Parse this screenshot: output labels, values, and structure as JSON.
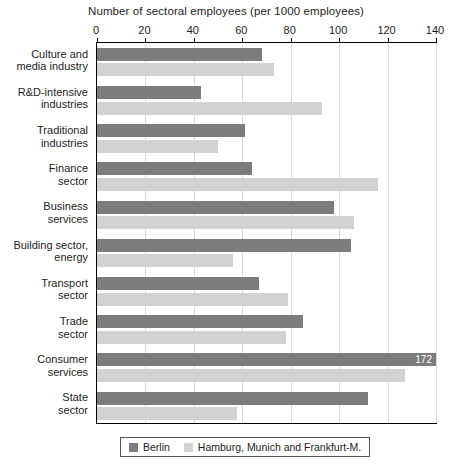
{
  "chart_data": {
    "type": "bar",
    "orientation": "horizontal",
    "title": "Number of sectoral employees (per 1000 employees)",
    "xlabel": "",
    "ylabel": "",
    "xlim": [
      0,
      140
    ],
    "xticks": [
      0,
      20,
      40,
      60,
      80,
      100,
      120,
      140
    ],
    "grid": true,
    "legend_position": "bottom",
    "categories": [
      "Culture and media industry",
      "R&D-intensive industries",
      "Traditional industries",
      "Finance sector",
      "Business services",
      "Building sector, energy",
      "Transport sector",
      "Trade sector",
      "Consumer services",
      "State sector"
    ],
    "category_lines": [
      [
        "Culture and",
        "media industry"
      ],
      [
        "R&D-intensive",
        "industries"
      ],
      [
        "Traditional",
        "industries"
      ],
      [
        "Finance",
        "sector"
      ],
      [
        "Business",
        "services"
      ],
      [
        "Building sector,",
        "energy"
      ],
      [
        "Transport",
        "sector"
      ],
      [
        "Trade",
        "sector"
      ],
      [
        "Consumer",
        "services"
      ],
      [
        "State",
        "sector"
      ]
    ],
    "series": [
      {
        "name": "Berlin",
        "color": "#7c7c7c",
        "values": [
          68,
          43,
          61,
          64,
          98,
          105,
          67,
          85,
          172,
          112
        ],
        "labels": [
          null,
          null,
          null,
          null,
          null,
          null,
          null,
          null,
          "172",
          null
        ]
      },
      {
        "name": "Hamburg, Munich and Frankfurt-M.",
        "color": "#d2d2d2",
        "values": [
          73,
          93,
          50,
          116,
          106,
          56,
          79,
          78,
          127,
          58
        ],
        "labels": [
          null,
          null,
          null,
          null,
          null,
          null,
          null,
          null,
          null,
          null
        ]
      }
    ]
  },
  "legend": {
    "items": [
      {
        "label": "Berlin",
        "swatch": "berlin"
      },
      {
        "label": "Hamburg, Munich and Frankfurt-M.",
        "swatch": "other"
      }
    ]
  }
}
